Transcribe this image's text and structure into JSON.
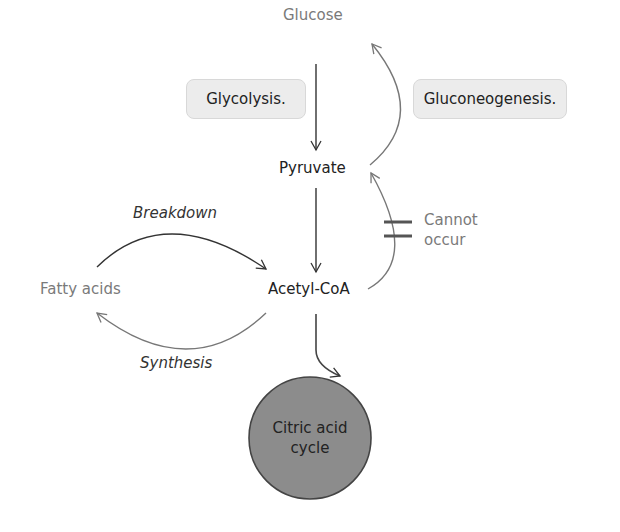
{
  "nodes": {
    "glucose": "Glucose",
    "pyruvate": "Pyruvate",
    "acetyl_coa": "Acetyl-CoA",
    "fatty_acids": "Fatty acids",
    "citric_acid_cycle_line1": "Citric acid",
    "citric_acid_cycle_line2": "cycle"
  },
  "processes": {
    "glycolysis": "Glycolysis.",
    "gluconeogenesis": "Gluconeogenesis."
  },
  "edge_labels": {
    "breakdown": "Breakdown",
    "synthesis": "Synthesis",
    "cannot_occur_line1": "Cannot",
    "cannot_occur_line2": "occur"
  },
  "colors": {
    "circle_fill": "#8c8c8c",
    "box_fill": "#ececec",
    "grey_text": "#7a7a7a"
  }
}
